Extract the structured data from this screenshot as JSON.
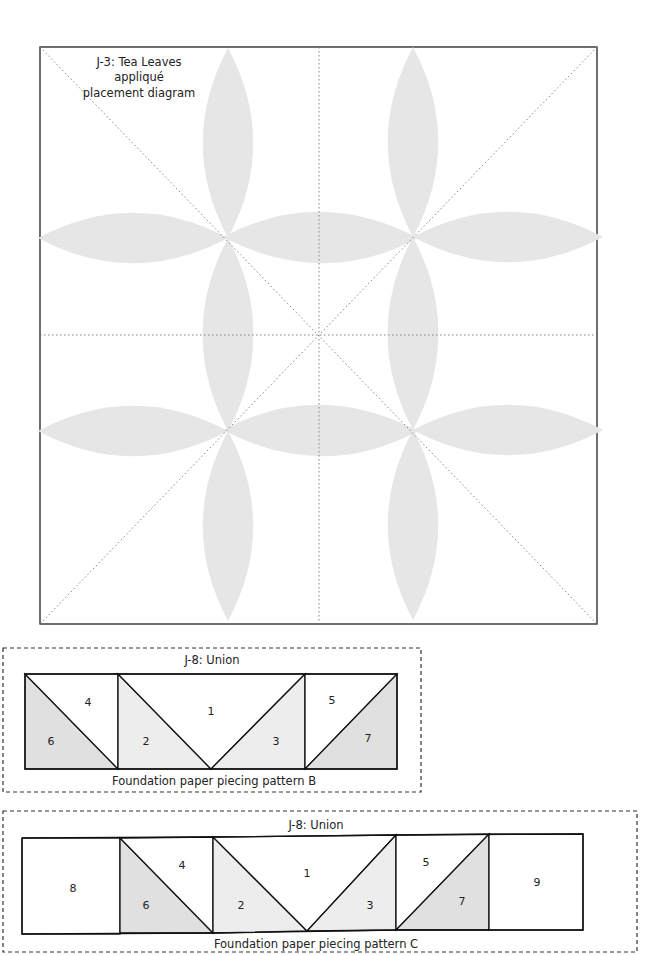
{
  "placement_diagram": {
    "title_lines": [
      "J-3: Tea Leaves",
      "appliqué",
      "placement diagram"
    ],
    "petal_color": "#e6e6e6",
    "flowers": 4,
    "petals_per_flower": 4
  },
  "pattern_b": {
    "title": "J-8: Union",
    "caption": "Foundation paper piecing pattern B",
    "labels": [
      "1",
      "2",
      "3",
      "4",
      "5",
      "6",
      "7"
    ]
  },
  "pattern_c": {
    "title": "J-8: Union",
    "caption": "Foundation paper piecing pattern C",
    "labels": [
      "1",
      "2",
      "3",
      "4",
      "5",
      "6",
      "7",
      "8",
      "9"
    ]
  },
  "colors": {
    "line": "#111111",
    "guide": "#777777",
    "shade_dark": "#e0e0e0",
    "shade_light": "#ededed"
  }
}
